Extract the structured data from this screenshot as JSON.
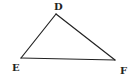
{
  "diagram": {
    "type": "triangle",
    "name": "Triangle DEF",
    "stroke_color": "#222222",
    "background": "#ffffff",
    "vertices": [
      {
        "label": "D",
        "x": 56,
        "y": 14,
        "label_x": 54,
        "label_y": 10
      },
      {
        "label": "E",
        "x": 21,
        "y": 58,
        "label_x": 12,
        "label_y": 71
      },
      {
        "label": "F",
        "x": 115,
        "y": 60,
        "label_x": 120,
        "label_y": 74
      }
    ],
    "edges": [
      {
        "name": "DE",
        "from": "D",
        "to": "E"
      },
      {
        "name": "EF",
        "from": "E",
        "to": "F"
      },
      {
        "name": "FD",
        "from": "F",
        "to": "D"
      }
    ]
  }
}
